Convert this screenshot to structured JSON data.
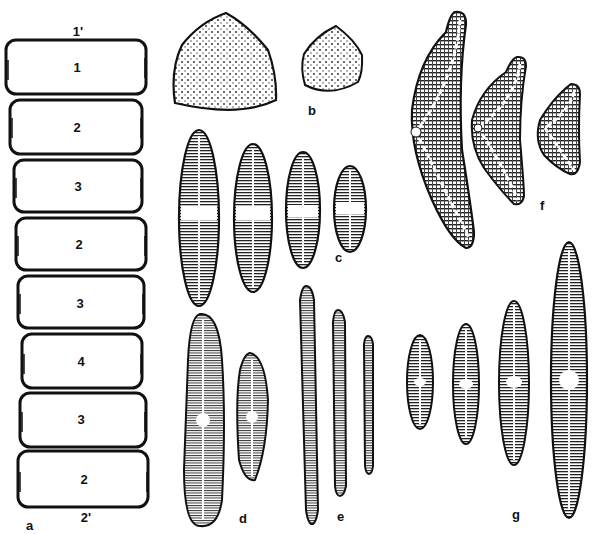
{
  "figure": {
    "panel_a": {
      "label": "a",
      "top_label": "1'",
      "bottom_label": "2'",
      "cells": [
        "1",
        "2",
        "3",
        "2",
        "3",
        "4",
        "3",
        "2"
      ]
    },
    "panel_b": {
      "label": "b"
    },
    "panel_c": {
      "label": "c"
    },
    "panel_d": {
      "label": "d"
    },
    "panel_e": {
      "label": "e"
    },
    "panel_f": {
      "label": "f"
    },
    "panel_g": {
      "label": "g"
    }
  },
  "colors": {
    "ink": "#111111",
    "background": "#ffffff"
  }
}
